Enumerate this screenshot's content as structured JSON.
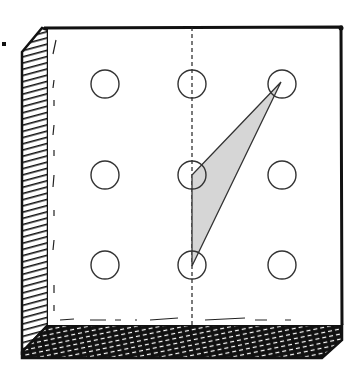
{
  "figure": {
    "title": "",
    "colors": {
      "ink": "#111111",
      "peg_stroke": "#333333",
      "triangle_fill": "#d6d6d6",
      "board_face": "#ffffff"
    },
    "pegs": {
      "rows": 3,
      "cols": 3,
      "x": [
        105,
        192,
        282
      ],
      "y": [
        84,
        175,
        265
      ],
      "radius": 14
    },
    "symmetry_line": {
      "x": 192,
      "y1": 27,
      "y2": 325,
      "style": "dashed"
    },
    "triangle": {
      "vertices": [
        [
          281,
          82
        ],
        [
          192,
          175
        ],
        [
          192,
          266
        ]
      ],
      "peg_indices": [
        [
          0,
          2
        ],
        [
          1,
          1
        ],
        [
          2,
          1
        ]
      ]
    },
    "marker_dot": {
      "x": 4,
      "y": 44
    }
  }
}
